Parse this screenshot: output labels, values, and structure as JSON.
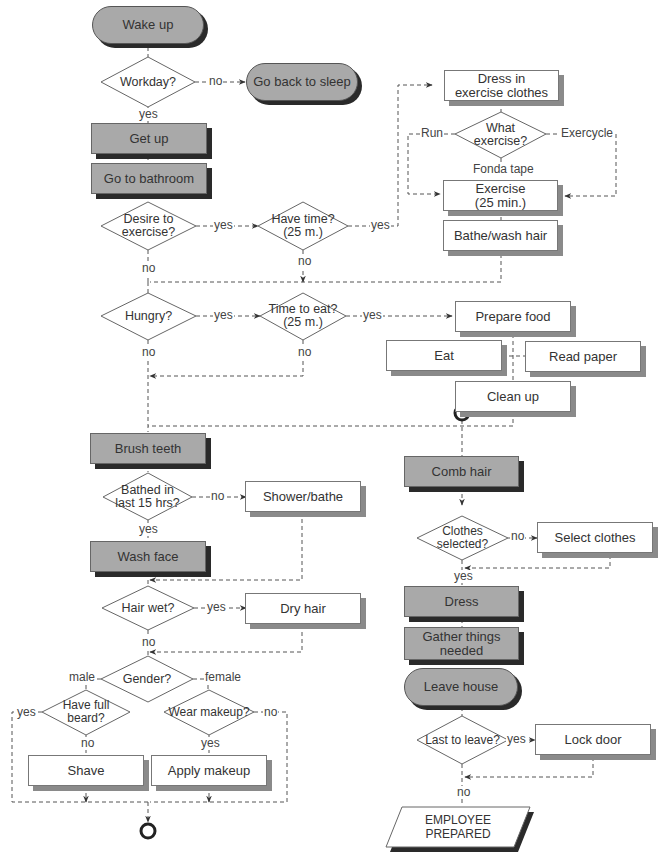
{
  "terminals": {
    "wake_up": "Wake up",
    "go_back_to_sleep": "Go back to sleep",
    "leave_house": "Leave house"
  },
  "processes": {
    "get_up": "Get up",
    "go_to_bathroom": "Go to bathroom",
    "dress_exercise_line1": "Dress in",
    "dress_exercise_line2": "exercise clothes",
    "exercise_line1": "Exercise",
    "exercise_line2": "(25 min.)",
    "bathe_wash_hair": "Bathe/wash hair",
    "prepare_food": "Prepare food",
    "eat": "Eat",
    "read_paper": "Read paper",
    "clean_up": "Clean up",
    "brush_teeth": "Brush teeth",
    "shower_bathe": "Shower/bathe",
    "wash_face": "Wash face",
    "dry_hair": "Dry hair",
    "shave": "Shave",
    "apply_makeup": "Apply makeup",
    "comb_hair": "Comb hair",
    "select_clothes": "Select clothes",
    "dress": "Dress",
    "gather_line1": "Gather things",
    "gather_line2": "needed",
    "lock_door": "Lock door"
  },
  "decisions": {
    "workday": "Workday?",
    "what_exercise_line1": "What",
    "what_exercise_line2": "exercise?",
    "desire_line1": "Desire to",
    "desire_line2": "exercise?",
    "have_time_line1": "Have time?",
    "have_time_line2": "(25 m.)",
    "hungry": "Hungry?",
    "time_to_eat_line1": "Time to eat?",
    "time_to_eat_line2": "(25 m.)",
    "bathed_line1": "Bathed in",
    "bathed_line2": "last 15 hrs?",
    "hair_wet": "Hair wet?",
    "gender": "Gender?",
    "beard_line1": "Have full",
    "beard_line2": "beard?",
    "makeup": "Wear makeup?",
    "clothes_line1": "Clothes",
    "clothes_line2": "selected?",
    "last_to_leave": "Last to leave?"
  },
  "output": {
    "line1": "EMPLOYEE",
    "line2": "PREPARED"
  },
  "edge_labels": {
    "workday_no": "no",
    "workday_yes": "yes",
    "run": "Run",
    "exercycle": "Exercycle",
    "fonda_tape": "Fonda tape",
    "desire_yes": "yes",
    "desire_no": "no",
    "have_time_yes": "yes",
    "have_time_no": "no",
    "hungry_yes": "yes",
    "hungry_no": "no",
    "time_eat_yes": "yes",
    "time_eat_no": "no",
    "bathed_no": "no",
    "bathed_yes": "yes",
    "hair_wet_yes": "yes",
    "hair_wet_no": "no",
    "male": "male",
    "female": "female",
    "beard_yes": "yes",
    "beard_no": "no",
    "makeup_no": "no",
    "makeup_yes": "yes",
    "clothes_no": "no",
    "clothes_yes": "yes",
    "last_yes": "yes",
    "last_no": "no"
  },
  "colors": {
    "gray_fill": "#a9a9a9",
    "shadow": "#2a2a2a",
    "line": "#555555"
  }
}
